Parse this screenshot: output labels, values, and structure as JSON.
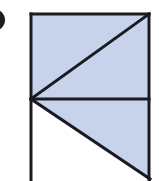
{
  "figure": {
    "label": "geometric-diagram",
    "title": "Rectangle divided by a horizontal segment and two diagonals",
    "canvas": {
      "width": 159,
      "height": 181,
      "background": "#ffffff"
    },
    "colors": {
      "line": "#1a1a22",
      "fill_shaded": "#c6d3ea",
      "fill_empty": "#ffffff",
      "marker": "#1d1d1d"
    },
    "stroke_width": 3,
    "marker": {
      "name": "bullet-marker-partial",
      "shape": "circle",
      "center_x": -6,
      "center_y": 20,
      "radius": 11,
      "note": "partially cropped at left edge"
    },
    "points": {
      "top_left": {
        "x": 31,
        "y": 14
      },
      "top_right": {
        "x": 149,
        "y": 14
      },
      "mid_left": {
        "x": 31,
        "y": 99
      },
      "mid_right": {
        "x": 149,
        "y": 99
      },
      "bottom_left": {
        "x": 31,
        "y": 181
      },
      "bottom_right": {
        "x": 149,
        "y": 181
      },
      "diagonal_lower_end": {
        "x": 149,
        "y": 178
      }
    },
    "regions": [
      {
        "name": "upper-left-triangle",
        "fill": "#c6d3ea",
        "points": "31,14 31,99 149,14"
      },
      {
        "name": "upper-right-triangle",
        "fill": "#c6d3ea",
        "points": "31,99 149,14 149,99"
      },
      {
        "name": "lower-right-triangle",
        "fill": "#c6d3ea",
        "points": "31,99 149,99 149,178"
      },
      {
        "name": "lower-left-triangle",
        "fill": "#ffffff",
        "points": "31,99 149,178 149,181 31,181"
      }
    ],
    "segments": [
      {
        "name": "top-edge",
        "x1": 31,
        "y1": 14,
        "x2": 149,
        "y2": 14
      },
      {
        "name": "left-edge",
        "x1": 31,
        "y1": 14,
        "x2": 31,
        "y2": 181
      },
      {
        "name": "right-edge",
        "x1": 149,
        "y1": 14,
        "x2": 149,
        "y2": 181
      },
      {
        "name": "horizontal-divider",
        "x1": 31,
        "y1": 99,
        "x2": 149,
        "y2": 99
      },
      {
        "name": "upper-diagonal",
        "x1": 31,
        "y1": 99,
        "x2": 149,
        "y2": 14
      },
      {
        "name": "lower-diagonal",
        "x1": 31,
        "y1": 99,
        "x2": 149,
        "y2": 178
      }
    ]
  }
}
